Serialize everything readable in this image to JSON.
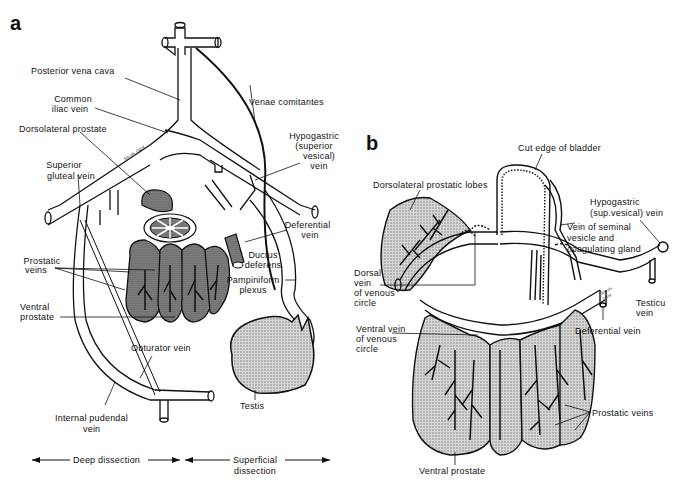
{
  "figure": {
    "panels": [
      {
        "id": "a",
        "label": "a",
        "labels": {
          "posterior_vena_cava": "Posterior vena cava",
          "common_iliac_vein_1": "Common",
          "common_iliac_vein_2": "iliac vein",
          "dorsolateral_prostate": "Dorsolateral prostate",
          "venae_comitantes": "Venae comitantes",
          "hypogastric_1": "Hypogastric",
          "hypogastric_2": "(superior",
          "hypogastric_3": "vesical)",
          "hypogastric_4": "vein",
          "superior_gluteal_1": "Superior",
          "superior_gluteal_2": "gluteal vein",
          "deferential_vein_1": "Deferential",
          "deferential_vein_2": "vein",
          "ductus_deferens_1": "Ductus",
          "ductus_deferens_2": "deferens",
          "prostatic_veins_1": "Prostatic",
          "prostatic_veins_2": "veins",
          "pampiniform_1": "Pampiniform",
          "pampiniform_2": "plexus",
          "ventral_prostate_1": "Ventral",
          "ventral_prostate_2": "prostate",
          "obturator_vein": "Obturator vein",
          "testis": "Testis",
          "internal_pudendal_1": "Internal pudendal",
          "internal_pudendal_2": "vein",
          "small_annotation": "Sm.vls. Dorsl."
        },
        "footer": {
          "deep_dissection": "Deep dissection",
          "superficial_1": "Superficial",
          "superficial_2": "dissection"
        }
      },
      {
        "id": "b",
        "label": "b",
        "labels": {
          "cut_edge_of_bladder": "Cut edge of bladder",
          "dorsolateral_prostatic_lobes": "Dorsolateral prostatic lobes",
          "hypogastric_1": "Hypogastric",
          "hypogastric_2": "(sup.vesical) vein",
          "vein_seminal_1": "Vein of seminal",
          "vein_seminal_2": "vesicle and",
          "vein_seminal_3": "coagulating gland",
          "dorsal_vein_1": "Dorsal",
          "dorsal_vein_2": "vein",
          "dorsal_vein_3": "of venous",
          "dorsal_vein_4": "circle",
          "testic_vein_1": "Testicu",
          "testic_vein_2": "vein",
          "deferential_vein": "Deferential vein",
          "ventral_vein_1": "Ventral vein",
          "ventral_vein_2": "of venous",
          "ventral_vein_3": "circle",
          "prostatic_veins": "Prostatic veins",
          "ventral_prostate": "Ventral prostate",
          "small_annotation_1": "Sm.vls.",
          "small_annotation_2": "Dorsl."
        }
      }
    ],
    "colors": {
      "ink": "#111111",
      "shade": "#9a9a9a",
      "paper": "#ffffff"
    }
  }
}
